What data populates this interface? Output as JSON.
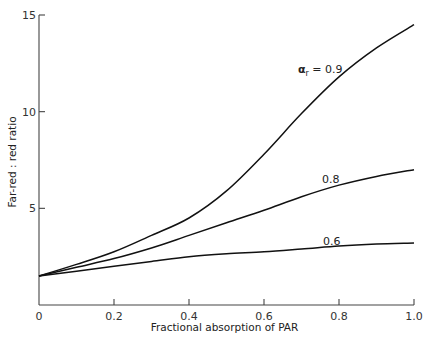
{
  "chart_data": {
    "type": "line",
    "title": "",
    "xlabel": "Fractional absorption of PAR",
    "ylabel": "Far-red : red ratio",
    "xlim": [
      0,
      1.0
    ],
    "ylim": [
      0,
      15
    ],
    "xticks": [
      "0",
      "0.2",
      "0.4",
      "0.6",
      "0.8",
      "1.0"
    ],
    "yticks": [
      "5",
      "10",
      "15"
    ],
    "grid": false,
    "legend": "inline curve labels",
    "x": [
      0,
      0.1,
      0.2,
      0.3,
      0.4,
      0.5,
      0.6,
      0.7,
      0.8,
      0.9,
      1.0
    ],
    "series": [
      {
        "name": "α_r = 0.9",
        "label_prefix": "α",
        "label_sub": "r",
        "label_value": "= 0.9",
        "values": [
          1.5,
          2.1,
          2.75,
          3.6,
          4.5,
          5.9,
          7.8,
          9.9,
          11.8,
          13.3,
          14.5
        ]
      },
      {
        "name": "0.8",
        "label_value": "0.8",
        "values": [
          1.5,
          1.95,
          2.4,
          2.95,
          3.6,
          4.25,
          4.9,
          5.6,
          6.2,
          6.65,
          7.0
        ]
      },
      {
        "name": "0.6",
        "label_value": "0.6",
        "values": [
          1.5,
          1.75,
          2.0,
          2.25,
          2.5,
          2.65,
          2.75,
          2.9,
          3.05,
          3.15,
          3.2
        ]
      }
    ]
  }
}
